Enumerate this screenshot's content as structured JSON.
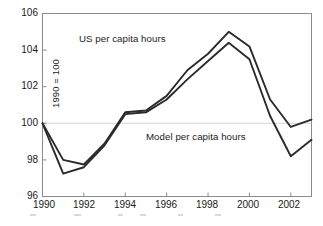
{
  "chart_data": {
    "type": "line",
    "title": "",
    "xlabel": "",
    "ylabel": "1990 = 100",
    "xlim": [
      1990,
      2003
    ],
    "ylim": [
      96,
      106
    ],
    "ytick_values": [
      96,
      98,
      100,
      102,
      104,
      106
    ],
    "ytick_labels": [
      "96",
      "98",
      "100",
      "102",
      "104",
      "106"
    ],
    "xtick_values": [
      1990,
      1992,
      1994,
      1996,
      1998,
      2000,
      2002
    ],
    "xtick_labels": [
      "1990",
      "1992",
      "1994",
      "1996",
      "1998",
      "2000",
      "2002"
    ],
    "grid": "horizontal reference line at y = 100 only",
    "legend_position": "inline annotations on plot",
    "x": [
      1990,
      1991,
      1992,
      1993,
      1994,
      1995,
      1996,
      1997,
      1998,
      1999,
      2000,
      2001,
      2002,
      2003
    ],
    "series": [
      {
        "name": "US per capita hours",
        "label": "US per capita hours",
        "color": "#2b2b2b",
        "values": [
          100.0,
          98.0,
          97.75,
          98.9,
          100.6,
          100.7,
          101.5,
          102.9,
          103.8,
          105.0,
          104.2,
          101.3,
          99.8,
          100.2
        ]
      },
      {
        "name": "Model per capita hours",
        "label": "Model per capita hours",
        "color": "#2b2b2b",
        "values": [
          100.0,
          97.25,
          97.6,
          98.8,
          100.5,
          100.6,
          101.3,
          102.4,
          103.4,
          104.4,
          103.5,
          100.4,
          98.2,
          99.1
        ]
      }
    ],
    "annotations": [
      {
        "text": "US per capita hours",
        "x": 1991.8,
        "y": 104.1
      },
      {
        "text": "Model per capita hours",
        "x": 1995.2,
        "y": 99.0
      }
    ],
    "reference_line": {
      "y": 100,
      "style": "thin light gray"
    }
  },
  "axis_style": {
    "frame_color": "#8c8c8c",
    "text_color": "#1a1a1a",
    "line_color": "#2b2b2b",
    "background": "#ffffff"
  }
}
